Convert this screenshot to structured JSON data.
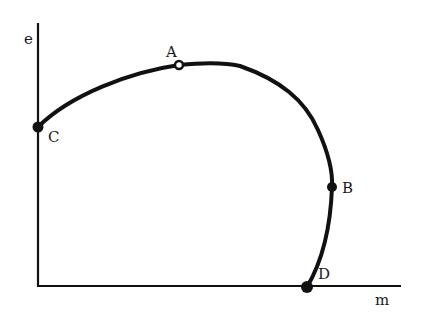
{
  "diagram": {
    "type": "curve-on-axes",
    "axes": {
      "y_label": "e",
      "x_label": "m"
    },
    "points": [
      {
        "id": "A",
        "label": "A",
        "description": "maximum of e",
        "marker": "open-dot"
      },
      {
        "id": "B",
        "label": "B",
        "description": "point where curve is vertical (max m)",
        "marker": "filled-dot"
      },
      {
        "id": "C",
        "label": "C",
        "description": "intersection with e axis",
        "marker": "filled-dot"
      },
      {
        "id": "D",
        "label": "D",
        "description": "intersection with m axis",
        "marker": "filled-dot"
      }
    ],
    "curve": {
      "path_order": [
        "C",
        "A",
        "B",
        "D"
      ],
      "color": "#111111"
    },
    "colors": {
      "ink": "#111111",
      "background": "#ffffff"
    }
  }
}
